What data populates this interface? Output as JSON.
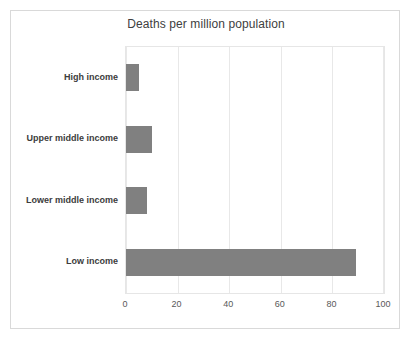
{
  "chart_data": {
    "type": "bar",
    "orientation": "horizontal",
    "title": "Deaths per million population",
    "xlabel": "",
    "ylabel": "",
    "categories": [
      "High income",
      "Upper middle income",
      "Lower middle income",
      "Low income"
    ],
    "values": [
      5,
      10,
      8,
      89
    ],
    "xlim": [
      0,
      100
    ],
    "xticks": [
      0,
      20,
      40,
      60,
      80,
      100
    ],
    "xtick_labels": [
      "0",
      "20",
      "40",
      "60",
      "80",
      "100"
    ],
    "grid": true,
    "grid_axis": "x",
    "legend": false,
    "series": [
      {
        "name": "Deaths per million population",
        "values": [
          5,
          10,
          8,
          89
        ]
      }
    ]
  },
  "style": {
    "bar_color": "#808080",
    "grid_color": "#e8e8e8",
    "plot_border_color": "#e6e6e6",
    "frame_border_color": "#d9d9d9",
    "background": "#ffffff",
    "title_color": "#404040",
    "category_label_color": "#3c3c3c",
    "tick_label_color": "#595959"
  }
}
